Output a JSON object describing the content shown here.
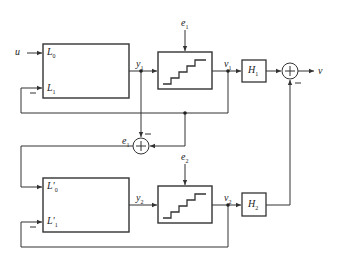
{
  "diagram": {
    "type": "block-diagram",
    "input": "u",
    "output": "v",
    "upper_block": {
      "in0": "L",
      "in0_sub": "0",
      "in1": "L",
      "in1_sub": "1",
      "output": "y",
      "output_sub": "1"
    },
    "lower_block": {
      "in0": "L′",
      "in0_sub": "0",
      "in1": "L′",
      "in1_sub": "1",
      "output": "y",
      "output_sub": "2"
    },
    "quantizer1": {
      "error": "e",
      "error_sub": "1",
      "output": "v",
      "output_sub": "1"
    },
    "quantizer2": {
      "error": "e",
      "error_sub": "2",
      "output": "v",
      "output_sub": "2"
    },
    "filter1": {
      "label": "H",
      "sub": "1"
    },
    "filter2": {
      "label": "H",
      "sub": "2"
    },
    "error_sum": {
      "label": "e",
      "sub": "1",
      "sign_top": "−"
    },
    "output_sum": {
      "sign_bottom": "−"
    },
    "feedback_sign": "−",
    "line_color": "#333333"
  }
}
